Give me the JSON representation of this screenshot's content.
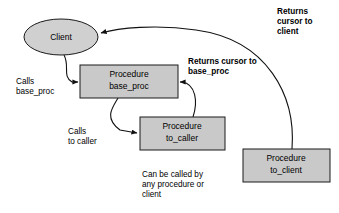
{
  "diagram": {
    "canvas": {
      "width": 339,
      "height": 213,
      "background": "#ffffff"
    },
    "colors": {
      "box_fill": "#c9c9c9",
      "ellipse_fill": "#d0d0d0",
      "stroke": "#1a1a1a",
      "arrow": "#111111",
      "text": "#000000"
    },
    "nodes": [
      {
        "id": "client",
        "shape": "ellipse",
        "label": "Client",
        "cx": 61,
        "cy": 37,
        "rx": 37,
        "ry": 18
      },
      {
        "id": "base_proc",
        "shape": "rect",
        "label_line1": "Procedure",
        "label_line2": "base_proc",
        "x": 80,
        "y": 65,
        "width": 98,
        "height": 33
      },
      {
        "id": "to_caller",
        "shape": "rect",
        "label_line1": "Procedure",
        "label_line2": "to_caller",
        "x": 140,
        "y": 117,
        "width": 85,
        "height": 33
      },
      {
        "id": "to_client",
        "shape": "rect",
        "label_line1": "Procedure",
        "label_line2": "to_client",
        "x": 243,
        "y": 149,
        "width": 87,
        "height": 33
      }
    ],
    "labels": [
      {
        "id": "calls-base-proc",
        "text": "Calls\nbase_proc",
        "bold": false,
        "x": 16,
        "y": 77
      },
      {
        "id": "calls-to-caller",
        "text": "Calls\nto caller",
        "bold": false,
        "x": 68,
        "y": 127
      },
      {
        "id": "returns-cursor-to-base-proc",
        "text": "Returns cursor to\nbase_proc",
        "bold": true,
        "x": 188,
        "y": 57
      },
      {
        "id": "returns-cursor-to-client",
        "text": "Returns\ncursor to\nclient",
        "bold": true,
        "x": 277,
        "y": 7
      },
      {
        "id": "can-be-called-by",
        "text": "Can be called by\nany procedure or\nclient",
        "bold": false,
        "x": 142,
        "y": 170
      }
    ],
    "edges": [
      {
        "id": "client-to-base-proc",
        "from": "client",
        "to": "base_proc",
        "meaning": "Calls base_proc",
        "path": "M 64,55 C 70,66 62,76 72,82 L 78,82"
      },
      {
        "id": "base-proc-to-to-caller",
        "from": "base_proc",
        "to": "to_caller",
        "meaning": "Calls to caller",
        "path": "M 118,98 C 112,108 104,118 120,130 L 137,133"
      },
      {
        "id": "to-caller-returns-to-base-proc",
        "from": "to_caller",
        "to": "base_proc",
        "meaning": "Returns cursor to base_proc",
        "path": "M 193,117 C 198,102 196,84 182,82 L 180,82"
      },
      {
        "id": "to-client-returns-to-client",
        "from": "to_client",
        "to": "client",
        "meaning": "Returns cursor to client",
        "path": "M 292,149 C 296,96 268,40 196,30 C 156,24 118,28 101,33"
      }
    ]
  }
}
